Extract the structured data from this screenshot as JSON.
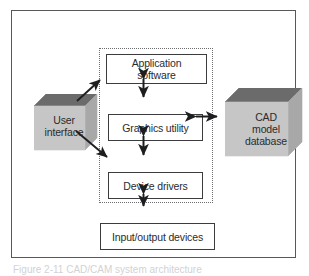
{
  "figure": {
    "caption": "Figure 2-11   CAD/CAM system architecture"
  },
  "enclosure": {
    "name": "cad-software-boundary"
  },
  "boxes": {
    "application_software": {
      "line1": "Application",
      "line2": "software"
    },
    "graphics_utility": {
      "label": "Graphics utility"
    },
    "device_drivers": {
      "label": "Device drivers"
    },
    "io_devices": {
      "label": "Input/output devices"
    }
  },
  "blocks": {
    "user_interface": {
      "line1": "User",
      "line2": "interface"
    },
    "cad_database": {
      "line1": "CAD",
      "line2": "model",
      "line3": "database"
    }
  },
  "arrows": [
    {
      "name": "application-to-graphics",
      "style": "double-headed-vertical"
    },
    {
      "name": "graphics-to-device-drivers",
      "style": "double-headed-vertical"
    },
    {
      "name": "device-drivers-to-io-devices",
      "style": "double-headed-vertical"
    },
    {
      "name": "graphics-to-cad-database",
      "style": "double-headed-horizontal"
    },
    {
      "name": "user-interface-to-application",
      "style": "single-headed-diagonal"
    },
    {
      "name": "user-interface-to-device-drivers",
      "style": "single-headed-diagonal"
    }
  ],
  "colors": {
    "frame": "#58585a",
    "dotted_border": "#6d6d6f",
    "box_border": "#3c3c3e",
    "block_front": "#c6c6c6",
    "block_top": "#6b6b6b",
    "block_side": "#a8a8a8",
    "text": "#2b2b2d",
    "background": "#ffffff"
  }
}
